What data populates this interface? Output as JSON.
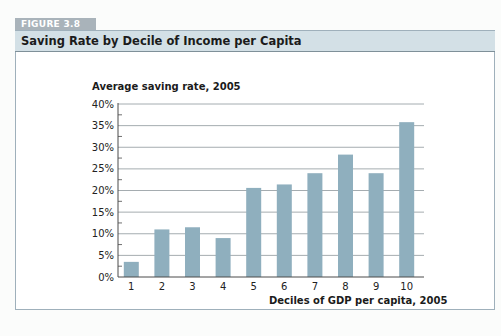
{
  "figure": {
    "label": "FIGURE 3.8",
    "title": "Saving Rate by Decile of Income per Capita"
  },
  "colors": {
    "bar": "#8fafbe",
    "header_band": "#d3e0e6",
    "tab": "#a9b3ba",
    "gridline": "#8e979c",
    "axis": "#4a4a4a"
  },
  "chart_data": {
    "type": "bar",
    "title": "Saving Rate by Decile of Income per Capita",
    "xlabel": "Deciles of GDP per capita, 2005",
    "ylabel": "Average saving rate, 2005",
    "categories": [
      "1",
      "2",
      "3",
      "4",
      "5",
      "6",
      "7",
      "8",
      "9",
      "10"
    ],
    "values": [
      3.5,
      11,
      11.5,
      9,
      20.6,
      21.4,
      24,
      28.3,
      24,
      35.8
    ],
    "value_unit": "%",
    "ylim": [
      0,
      40
    ],
    "yticks": [
      "0%",
      "5%",
      "10%",
      "15%",
      "20%",
      "25%",
      "30%",
      "35%",
      "40%"
    ],
    "grid": true,
    "legend": null
  }
}
